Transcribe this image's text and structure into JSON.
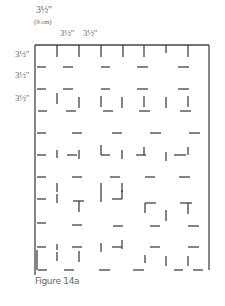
{
  "labels": {
    "top_first": "3½\"",
    "top_first_metric": "(9 cm)",
    "top_second": "3½\"",
    "top_third": "3½\"",
    "left_1": "3½\"",
    "left_2": "3½\"",
    "left_3": "3½\""
  },
  "caption": "Figure 14a",
  "colors": {
    "line": "#333333",
    "border": "#444444"
  },
  "grid": {
    "x0": 35,
    "y0": 45,
    "x1": 209,
    "y1": 270,
    "col_x": [
      35,
      57,
      79,
      100,
      122,
      144,
      166,
      187,
      209
    ],
    "row_y": [
      45,
      67,
      89,
      111,
      133,
      155,
      177,
      199,
      221,
      243,
      265
    ]
  },
  "segments": [
    [
      57,
      45,
      57,
      57
    ],
    [
      79,
      45,
      79,
      57
    ],
    [
      101,
      45,
      101,
      57
    ],
    [
      123,
      45,
      123,
      57
    ],
    [
      144,
      45,
      144,
      57
    ],
    [
      166,
      45,
      166,
      53
    ],
    [
      188,
      45,
      188,
      57
    ],
    [
      37,
      67,
      46,
      67
    ],
    [
      63,
      67,
      73,
      67
    ],
    [
      101,
      67,
      110,
      67
    ],
    [
      137,
      67,
      148,
      67
    ],
    [
      178,
      67,
      189,
      67
    ],
    [
      37,
      89,
      46,
      89
    ],
    [
      63,
      89,
      73,
      89
    ],
    [
      101,
      89,
      110,
      89
    ],
    [
      137,
      89,
      148,
      89
    ],
    [
      178,
      89,
      189,
      89
    ],
    [
      57,
      93,
      57,
      104
    ],
    [
      79,
      97,
      79,
      108
    ],
    [
      101,
      96,
      101,
      107
    ],
    [
      122,
      97,
      122,
      108
    ],
    [
      144,
      96,
      144,
      107
    ],
    [
      166,
      97,
      166,
      108
    ],
    [
      188,
      96,
      188,
      107
    ],
    [
      38,
      111,
      47,
      111
    ],
    [
      66,
      111,
      76,
      111
    ],
    [
      103,
      111,
      113,
      111
    ],
    [
      139,
      111,
      150,
      111
    ],
    [
      180,
      111,
      191,
      111
    ],
    [
      37,
      133,
      46,
      133
    ],
    [
      72,
      133,
      82,
      133
    ],
    [
      112,
      133,
      122,
      133
    ],
    [
      150,
      133,
      161,
      133
    ],
    [
      189,
      133,
      200,
      133
    ],
    [
      37,
      155,
      46,
      155
    ],
    [
      57,
      150,
      57,
      158
    ],
    [
      67,
      155,
      77,
      155
    ],
    [
      79,
      150,
      79,
      159
    ],
    [
      101,
      145,
      101,
      155
    ],
    [
      101,
      155,
      110,
      155
    ],
    [
      122,
      150,
      122,
      159
    ],
    [
      136,
      155,
      146,
      155
    ],
    [
      144,
      147,
      144,
      155
    ],
    [
      166,
      152,
      166,
      161
    ],
    [
      174,
      155,
      186,
      155
    ],
    [
      188,
      147,
      188,
      155
    ],
    [
      37,
      177,
      46,
      177
    ],
    [
      72,
      177,
      82,
      177
    ],
    [
      110,
      177,
      120,
      177
    ],
    [
      145,
      177,
      155,
      177
    ],
    [
      179,
      177,
      190,
      177
    ],
    [
      57,
      183,
      57,
      192
    ],
    [
      101,
      183,
      101,
      192
    ],
    [
      122,
      183,
      122,
      192
    ],
    [
      37,
      199,
      46,
      199
    ],
    [
      57,
      194,
      57,
      203
    ],
    [
      73,
      201,
      84,
      201
    ],
    [
      79,
      201,
      79,
      212
    ],
    [
      101,
      192,
      101,
      202
    ],
    [
      112,
      199,
      122,
      199
    ],
    [
      122,
      190,
      122,
      199
    ],
    [
      145,
      203,
      156,
      203
    ],
    [
      145,
      203,
      145,
      213
    ],
    [
      166,
      210,
      166,
      221
    ],
    [
      180,
      203,
      192,
      203
    ],
    [
      188,
      203,
      188,
      214
    ],
    [
      37,
      223,
      46,
      223
    ],
    [
      72,
      225,
      82,
      225
    ],
    [
      113,
      226,
      123,
      226
    ],
    [
      150,
      226,
      160,
      226
    ],
    [
      188,
      226,
      199,
      226
    ],
    [
      37,
      247,
      46,
      247
    ],
    [
      57,
      244,
      57,
      250
    ],
    [
      72,
      247,
      82,
      247
    ],
    [
      101,
      243,
      101,
      252
    ],
    [
      112,
      247,
      122,
      247
    ],
    [
      122,
      240,
      122,
      249
    ],
    [
      150,
      247,
      160,
      247
    ],
    [
      188,
      247,
      199,
      247
    ],
    [
      37,
      250,
      37,
      270
    ],
    [
      57,
      252,
      57,
      261
    ],
    [
      79,
      251,
      79,
      262
    ],
    [
      145,
      255,
      145,
      263
    ],
    [
      166,
      256,
      166,
      266
    ],
    [
      188,
      256,
      188,
      266
    ],
    [
      38,
      270,
      47,
      270
    ],
    [
      64,
      270,
      74,
      270
    ],
    [
      99,
      270,
      110,
      270
    ],
    [
      133,
      270,
      144,
      270
    ],
    [
      174,
      270,
      183,
      270
    ],
    [
      193,
      270,
      203,
      270
    ]
  ]
}
